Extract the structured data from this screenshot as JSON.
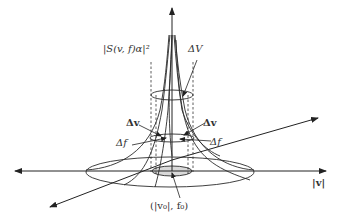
{
  "diagram": {
    "type": "3d-surface-sketch",
    "labels": {
      "vertical_axis": "|S(v, f)α|²",
      "delta_V": "ΔV",
      "delta_v_left": "Δv",
      "delta_v_right": "Δv",
      "delta_f_left": "Δf",
      "delta_f_right": "Δf",
      "horizontal_axis": "|v|",
      "center_point": "(|v₀|, f₀)"
    },
    "colors": {
      "line": "#222222",
      "text": "#333333",
      "background": "#ffffff",
      "shaded_base": "#d9d9d9"
    }
  }
}
